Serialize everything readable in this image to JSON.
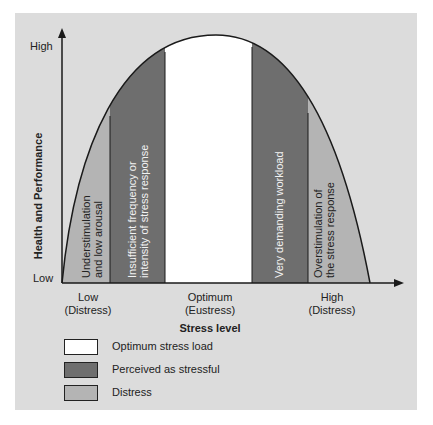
{
  "colors": {
    "background": "#dcdcdc",
    "optimum": "#ffffff",
    "perceived": "#6e6e6e",
    "distress": "#b4b4b4",
    "line": "#1a1a1a"
  },
  "axes": {
    "y_title": "Health and Performance",
    "y_high": "High",
    "y_low": "Low",
    "x_title": "Stress level",
    "x_ticks": [
      {
        "line1": "Low",
        "line2": "(Distress)"
      },
      {
        "line1": "Optimum",
        "line2": "(Eustress)"
      },
      {
        "line1": "High",
        "line2": "(Distress)"
      }
    ]
  },
  "zones": [
    {
      "label_line1": "Understimulation",
      "label_line2": "and low arousal",
      "type": "distress"
    },
    {
      "label_line1": "Insufficient frequency or",
      "label_line2": "intensity of stress response",
      "type": "perceived"
    },
    {
      "label_line1": "",
      "label_line2": "",
      "type": "optimum"
    },
    {
      "label_line1": "Very demanding workload",
      "label_line2": "",
      "type": "perceived"
    },
    {
      "label_line1": "Overstimulation of",
      "label_line2": "the stress response",
      "type": "distress"
    }
  ],
  "legend": [
    {
      "label": "Optimum stress load",
      "type": "optimum"
    },
    {
      "label": "Perceived as stressful",
      "type": "perceived"
    },
    {
      "label": "Distress",
      "type": "distress"
    }
  ]
}
